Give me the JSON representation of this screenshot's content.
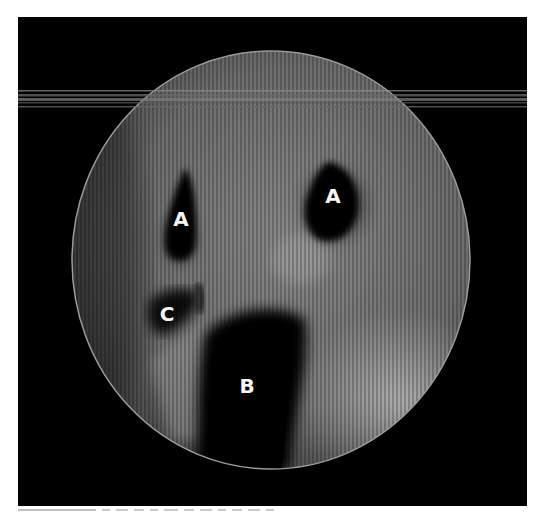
{
  "figure": {
    "type": "endoscopic-view",
    "frame_color": "#000000",
    "scope_circle": {
      "cx": 271,
      "cy": 260,
      "r": 205,
      "rim_color": "#9a9a9a"
    },
    "labels": [
      {
        "id": "A-left",
        "text": "A",
        "x": 181,
        "y": 226
      },
      {
        "id": "A-right",
        "text": "A",
        "x": 333,
        "y": 203
      },
      {
        "id": "C",
        "text": "C",
        "x": 167,
        "y": 321
      },
      {
        "id": "B",
        "text": "B",
        "x": 247,
        "y": 393
      }
    ]
  },
  "labels": {
    "a_left": "A",
    "a_right": "A",
    "c": "C",
    "b": "B"
  }
}
